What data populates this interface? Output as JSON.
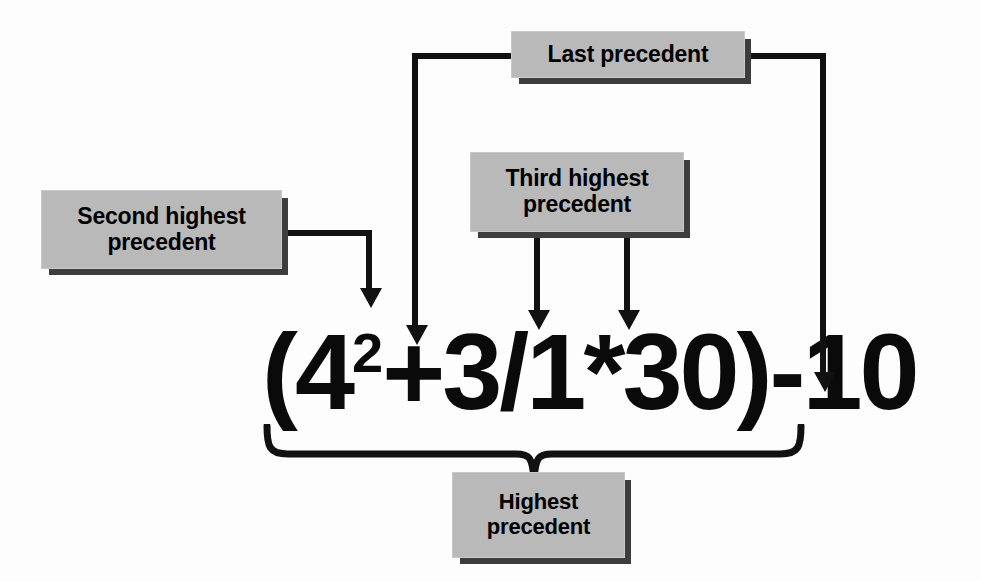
{
  "diagram": {
    "colors": {
      "background": "#fdfdfd",
      "box_fill": "#b9b9b9",
      "box_shadow": "#3d3d3d",
      "line": "#111111",
      "text": "#000000"
    },
    "formula": {
      "base": "(4",
      "exponent": "2",
      "rest": "+3/1*30)-10",
      "full_text": "(4^2+3/1*30)-10"
    },
    "callouts": [
      {
        "id": "last",
        "label": "Last precedent",
        "lines": [
          "Last precedent"
        ],
        "points_to": [
          "+",
          "-"
        ]
      },
      {
        "id": "second",
        "label": "Second highest precedent",
        "lines": [
          "Second highest",
          "precedent"
        ],
        "points_to": [
          "2"
        ]
      },
      {
        "id": "third",
        "label": "Third highest precedent",
        "lines": [
          "Third highest",
          "precedent"
        ],
        "points_to": [
          "/",
          "*"
        ]
      },
      {
        "id": "highest",
        "label": "Highest precedent",
        "lines": [
          "Highest",
          "precedent"
        ],
        "points_to": [
          "(4^2+3/1*30)"
        ]
      }
    ],
    "connectors": [
      {
        "id": "second-to-exponent",
        "kind": "elbow-arrow"
      },
      {
        "id": "last-to-plus",
        "kind": "elbow-arrow"
      },
      {
        "id": "last-to-minus",
        "kind": "elbow-arrow"
      },
      {
        "id": "third-to-divide",
        "kind": "straight-arrow"
      },
      {
        "id": "third-to-multiply",
        "kind": "straight-arrow"
      },
      {
        "id": "highest-brace",
        "kind": "curly-brace"
      }
    ]
  }
}
